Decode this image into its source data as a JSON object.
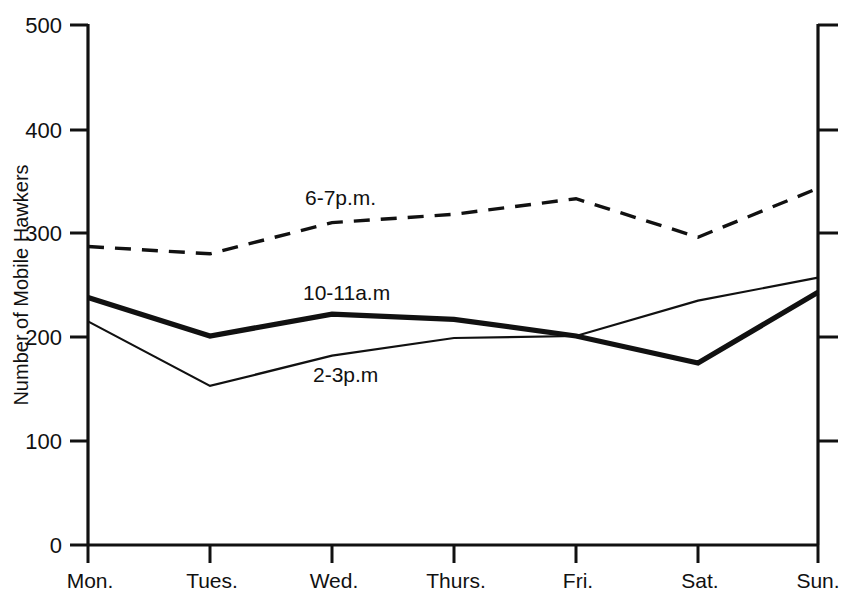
{
  "chart_data": {
    "type": "line",
    "title": "",
    "xlabel": "",
    "ylabel": "Number of Mobile Hawkers",
    "categories": [
      "Mon.",
      "Tues.",
      "Wed.",
      "Thurs.",
      "Fri.",
      "Sat.",
      "Sun."
    ],
    "ylim": [
      0,
      500
    ],
    "yticks": [
      0,
      100,
      200,
      300,
      400,
      500
    ],
    "ytick_labels": [
      "0",
      "100",
      "200",
      "300",
      "400",
      "500"
    ],
    "grid": false,
    "legend_position": "inline-annotations",
    "series": [
      {
        "name": "6-7p.m.",
        "style": "dashed",
        "values": [
          287,
          280,
          310,
          318,
          333,
          296,
          343
        ],
        "label_text": "6-7p.m.",
        "label_x": 305,
        "label_y": 205
      },
      {
        "name": "10-11a.m",
        "style": "thick-solid",
        "values": [
          238,
          201,
          222,
          217,
          201,
          175,
          243
        ],
        "label_text": "10-11a.m",
        "label_x": 303,
        "label_y": 300
      },
      {
        "name": "2-3p.m",
        "style": "thin-solid",
        "values": [
          215,
          153,
          182,
          199,
          201,
          235,
          257
        ],
        "label_text": "2-3p.m",
        "label_x": 313,
        "label_y": 382
      }
    ]
  },
  "axes": {
    "y_axis_title": "Number of Mobile Hawkers",
    "left_axis_name": "left-y-axis",
    "right_axis_name": "right-y-axis",
    "bottom_axis_name": "x-axis"
  }
}
